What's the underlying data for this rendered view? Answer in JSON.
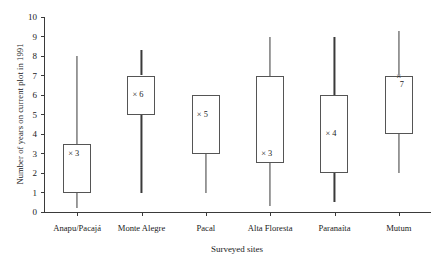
{
  "chart_data": {
    "type": "box",
    "title": "",
    "xlabel": "Surveyed sites",
    "ylabel": "Number of years on current plot in 1991",
    "ylim": [
      0,
      10
    ],
    "yticks": [
      0,
      1,
      2,
      3,
      4,
      5,
      6,
      7,
      8,
      9,
      10
    ],
    "grid": false,
    "legend": "none",
    "categories": [
      "Anapu/Pacajá",
      "Monte Alegre",
      "Pacal",
      "Alta Floresta",
      "Paranaíta",
      "Mutum"
    ],
    "boxes": [
      {
        "category": "Anapu/Pacajá",
        "whisker_low": 0.2,
        "q1": 1.0,
        "median": 3,
        "q3": 3.5,
        "whisker_high": 8.0,
        "median_label": "× 3",
        "median_marker_inside": true
      },
      {
        "category": "Monte Alegre",
        "whisker_low": 1.0,
        "q1": 5.0,
        "median": 6,
        "q3": 7.0,
        "whisker_high": 8.3,
        "median_label": "× 6",
        "median_marker_inside": true
      },
      {
        "category": "Pacal",
        "whisker_low": 1.0,
        "q1": 3.0,
        "median": 5,
        "q3": 6.0,
        "whisker_high": 6.0,
        "median_label": "× 5",
        "median_marker_inside": true
      },
      {
        "category": "Alta Floresta",
        "whisker_low": 0.3,
        "q1": 2.5,
        "median": 3,
        "q3": 7.0,
        "whisker_high": 9.0,
        "median_label": "× 3",
        "median_marker_inside": true
      },
      {
        "category": "Paranaíta",
        "whisker_low": 0.5,
        "q1": 2.0,
        "median": 4,
        "q3": 6.0,
        "whisker_high": 9.0,
        "median_label": "× 4",
        "median_marker_inside": true
      },
      {
        "category": "Mutum",
        "whisker_low": 2.0,
        "q1": 4.0,
        "median": 7,
        "q3": 7.0,
        "whisker_high": 9.3,
        "median_label": "7",
        "median_marker_inside": false,
        "median_marker_glyph": "×"
      }
    ]
  },
  "colors": {
    "axis": "#3a3a3a",
    "box_stroke": "#555555",
    "background": "#ffffff",
    "text": "#1a1a1a"
  }
}
